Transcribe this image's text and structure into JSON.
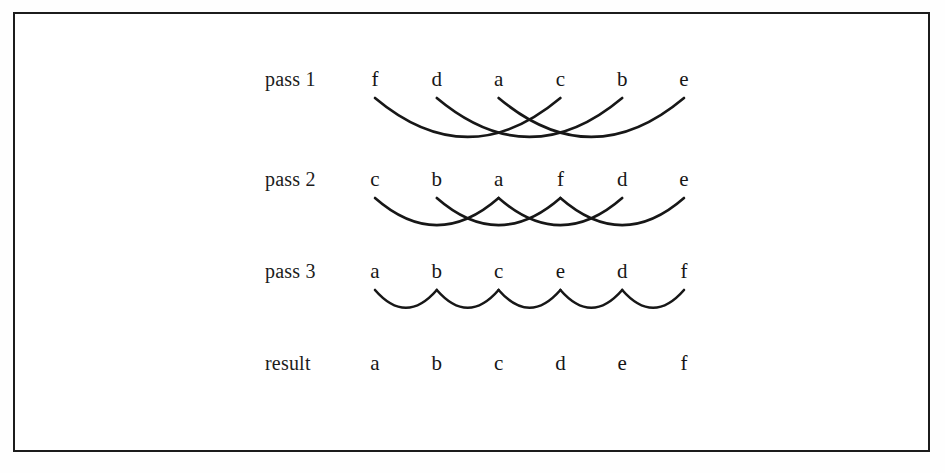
{
  "figure": {
    "background_color": "#ffffff",
    "border_color": "#1c1c1c",
    "ink_color": "#171717"
  },
  "layout": {
    "label_x": 265,
    "first_item_x": 375,
    "item_spacing": 61.8,
    "item_count": 6,
    "rows_y": [
      86,
      186,
      278,
      370
    ]
  },
  "rows": [
    {
      "label": "pass 1",
      "label_y": 86,
      "items": [
        "f",
        "d",
        "a",
        "c",
        "b",
        "e"
      ],
      "arc_depth": 41,
      "arcs": [
        {
          "from": 0,
          "to": 3
        },
        {
          "from": 1,
          "to": 4
        },
        {
          "from": 2,
          "to": 5
        }
      ]
    },
    {
      "label": "pass 2",
      "label_y": 186,
      "items": [
        "c",
        "b",
        "a",
        "f",
        "d",
        "e"
      ],
      "arc_depth": 31,
      "arcs": [
        {
          "from": 0,
          "to": 2
        },
        {
          "from": 1,
          "to": 3
        },
        {
          "from": 2,
          "to": 4
        },
        {
          "from": 3,
          "to": 5
        }
      ]
    },
    {
      "label": "pass 3",
      "label_y": 278,
      "items": [
        "a",
        "b",
        "c",
        "e",
        "d",
        "f"
      ],
      "arc_depth": 22,
      "arcs": [
        {
          "from": 0,
          "to": 1
        },
        {
          "from": 1,
          "to": 2
        },
        {
          "from": 2,
          "to": 3
        },
        {
          "from": 3,
          "to": 4
        },
        {
          "from": 4,
          "to": 5
        }
      ]
    },
    {
      "label": "result",
      "label_y": 370,
      "items": [
        "a",
        "b",
        "c",
        "d",
        "e",
        "f"
      ],
      "arc_depth": 0,
      "arcs": []
    }
  ]
}
